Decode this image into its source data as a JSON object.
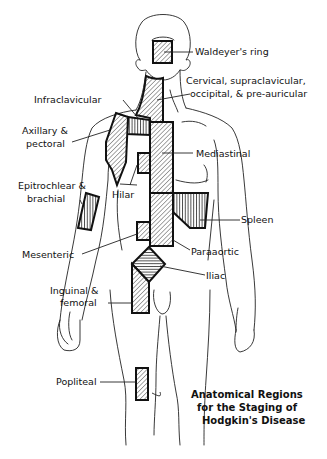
{
  "diagram": {
    "title_lines": [
      "Anatomical Regions",
      "for the Staging of",
      "Hodgkin's Disease"
    ],
    "labels": {
      "waldeyer": "Waldeyer's ring",
      "cervical_1": "Cervical, supraclavicular,",
      "cervical_2": "occipital, & pre-auricular",
      "infraclavicular": "Infraclavicular",
      "axillary_1": "Axillary &",
      "axillary_2": "pectoral",
      "mediastinal": "Mediastinal",
      "hilar": "Hilar",
      "epitrochlear_1": "Epitrochlear &",
      "epitrochlear_2": "brachial",
      "spleen": "Spleen",
      "mesenteric": "Mesenteric",
      "paraaortic": "Paraaortic",
      "iliac": "Iliac",
      "inguinal_1": "Inguinal &",
      "inguinal_2": "femoral",
      "popliteal": "Popliteal"
    },
    "regions": [
      {
        "id": "waldeyer",
        "pattern": "diagonal"
      },
      {
        "id": "cervical",
        "pattern": "diagonal"
      },
      {
        "id": "infraclavicular",
        "pattern": "vertical"
      },
      {
        "id": "axillary",
        "pattern": "diagonal"
      },
      {
        "id": "mediastinal",
        "pattern": "diagonal"
      },
      {
        "id": "hilar",
        "pattern": "diagonal"
      },
      {
        "id": "epitrochlear",
        "pattern": "vertical"
      },
      {
        "id": "spleen",
        "pattern": "vertical"
      },
      {
        "id": "paraaortic",
        "pattern": "diagonal"
      },
      {
        "id": "mesenteric",
        "pattern": "diagonal"
      },
      {
        "id": "iliac",
        "pattern": "horizontal"
      },
      {
        "id": "inguinal",
        "pattern": "diagonal"
      },
      {
        "id": "popliteal",
        "pattern": "diagonal"
      }
    ],
    "colors": {
      "ink": "#111111",
      "background": "#ffffff"
    }
  }
}
